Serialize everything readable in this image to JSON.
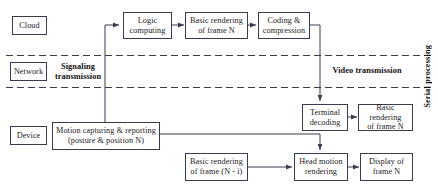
{
  "diagram": {
    "colors": {
      "box_border": "#3b3b4f",
      "line": "#3b3b4f",
      "text": "#1a1a1a",
      "background": "#ffffff"
    },
    "layers": [
      {
        "id": "cloud",
        "label": "Cloud"
      },
      {
        "id": "network",
        "label": "Network"
      },
      {
        "id": "device",
        "label": "Device"
      }
    ],
    "nodes": [
      {
        "id": "logic-computing",
        "label": "Logic\ncomputing"
      },
      {
        "id": "basic-rendering-n",
        "label": "Basic rendering\nof frame N"
      },
      {
        "id": "coding-compression",
        "label": "Coding &\ncompression"
      },
      {
        "id": "motion-capturing",
        "label": "Motion capturing & reporting\n(posture & position N)"
      },
      {
        "id": "terminal-decoding",
        "label": "Terminal\ndecoding"
      },
      {
        "id": "basic-rendering-n-dev",
        "label": "Basic rendering\nof frame N"
      },
      {
        "id": "basic-rendering-n-i",
        "label": "Basic rendering\nof frame (N - i)"
      },
      {
        "id": "head-motion-rendering",
        "label": "Head motion\nrendering"
      },
      {
        "id": "display-frame-n",
        "label": "Display of\nframe N"
      }
    ],
    "annotations": [
      {
        "id": "signaling-transmission",
        "label": "Signaling\ntransmission"
      },
      {
        "id": "video-transmission",
        "label": "Video transmission"
      },
      {
        "id": "serial-processing",
        "label": "Serial processing"
      }
    ]
  }
}
